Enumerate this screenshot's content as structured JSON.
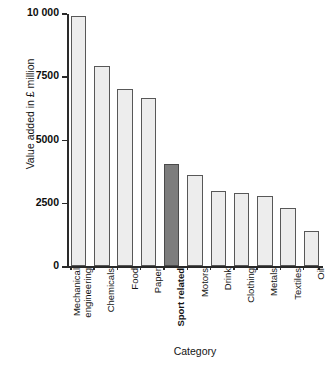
{
  "chart_data": {
    "type": "bar",
    "title": "",
    "xlabel": "Category",
    "ylabel": "Value added in £ million",
    "ylim": [
      0,
      10000
    ],
    "yticks": [
      0,
      2500,
      5000,
      7500,
      10000
    ],
    "ytick_labels": [
      "0",
      "2500",
      "5000",
      "7500",
      "10 000"
    ],
    "grid": false,
    "legend": null,
    "highlight_category": "Sport related",
    "categories": [
      "Mechanical engineering",
      "Chemicals",
      "Food",
      "Paper",
      "Sport related",
      "Motors",
      "Drink",
      "Clothing",
      "Metals",
      "Textiles",
      "Oil"
    ],
    "category_lines": [
      [
        "Mechanical",
        "engineering"
      ],
      [
        "Chemicals"
      ],
      [
        "Food"
      ],
      [
        "Paper"
      ],
      [
        "Sport related"
      ],
      [
        "Motors"
      ],
      [
        "Drink"
      ],
      [
        "Clothing"
      ],
      [
        "Metals"
      ],
      [
        "Textiles"
      ],
      [
        "Oil"
      ]
    ],
    "values": [
      9900,
      7900,
      7000,
      6650,
      4050,
      3600,
      2950,
      2880,
      2750,
      2300,
      1400
    ],
    "colors": {
      "bar_fill": "#ededed",
      "bar_edge": "#585858",
      "highlight_fill": "#7d7d7d",
      "highlight_edge": "#4a4a4a",
      "axis": "#2a2a2a",
      "text": "#141414",
      "background": "#ffffff"
    }
  }
}
